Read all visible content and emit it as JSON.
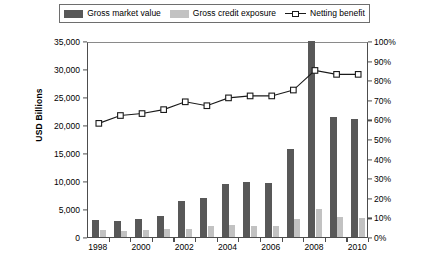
{
  "legend": {
    "items": [
      {
        "label": "Gross market value",
        "marker": "dark-square-swatch",
        "color": "#585858"
      },
      {
        "label": "Gross credit exposure",
        "marker": "light-square-swatch",
        "color": "#c2c2c2"
      },
      {
        "label": "Netting benefit",
        "marker": "line-with-open-square-marker",
        "color": "#1a1a1a"
      }
    ]
  },
  "chart_data": {
    "type": "bar",
    "title": "",
    "xlabel": "",
    "ylabel": "USD Billions",
    "y2label": "",
    "grid": false,
    "legend_position": "top",
    "categories": [
      "1998",
      "1999",
      "2000",
      "2001",
      "2002",
      "2003",
      "2004",
      "2005",
      "2006",
      "2007",
      "2008",
      "2009",
      "2010"
    ],
    "x_tick_labels": [
      "1998",
      "2000",
      "2002",
      "2004",
      "2006",
      "2008",
      "2010"
    ],
    "ylim": [
      0,
      35000
    ],
    "y_ticks": [
      0,
      5000,
      10000,
      15000,
      20000,
      25000,
      30000,
      35000
    ],
    "y_tick_labels": [
      "0",
      "5,000",
      "10,000",
      "15,000",
      "20,000",
      "25,000",
      "30,000",
      "35,000"
    ],
    "y2lim": [
      0,
      100
    ],
    "y2_ticks": [
      0,
      10,
      20,
      30,
      40,
      50,
      60,
      70,
      80,
      90,
      100
    ],
    "y2_tick_labels": [
      "0%",
      "10%",
      "20%",
      "30%",
      "40%",
      "50%",
      "60%",
      "70%",
      "80%",
      "90%",
      "100%"
    ],
    "series": [
      {
        "name": "Gross market value",
        "type": "bar",
        "axis": "left",
        "color": "#585858",
        "values": [
          3000,
          2800,
          3200,
          3800,
          6400,
          7000,
          9400,
          9800,
          9700,
          15800,
          35000,
          21500,
          21000
        ]
      },
      {
        "name": "Gross credit exposure",
        "type": "bar",
        "axis": "left",
        "color": "#c2c2c2",
        "values": [
          1200,
          1100,
          1300,
          1400,
          1500,
          1900,
          2100,
          2000,
          2000,
          3200,
          5000,
          3500,
          3400
        ]
      },
      {
        "name": "Netting benefit",
        "type": "line",
        "axis": "right",
        "color": "#1a1a1a",
        "values": [
          59,
          63,
          64,
          66,
          70,
          68,
          72,
          73,
          73,
          76,
          86,
          84,
          84
        ]
      }
    ]
  }
}
